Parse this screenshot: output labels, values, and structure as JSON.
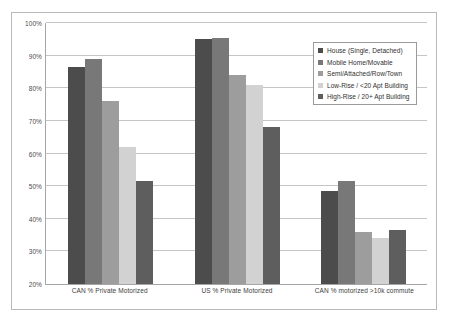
{
  "chart_data": {
    "type": "bar",
    "title": "",
    "xlabel": "",
    "ylabel": "",
    "ylim": [
      20,
      100
    ],
    "ytick_labels": [
      "100%",
      "90%",
      "80%",
      "70%",
      "60%",
      "50%",
      "40%",
      "30%",
      "20%"
    ],
    "ytick_values": [
      100,
      90,
      80,
      70,
      60,
      50,
      40,
      30,
      20
    ],
    "grid": true,
    "legend_position": "top-right",
    "categories": [
      "CAN % Private Motorized",
      "US % Private Motorized",
      "CAN % motorized  >10k commute"
    ],
    "series": [
      {
        "name": "House (Single, Detached)",
        "color": "#4c4c4c",
        "values": [
          86.5,
          95.0,
          48.5
        ]
      },
      {
        "name": "Mobile Home/Movable",
        "color": "#787878",
        "values": [
          89.0,
          95.5,
          51.5
        ]
      },
      {
        "name": "Semi/Attached/Row/Town",
        "color": "#9d9d9d",
        "values": [
          76.0,
          84.0,
          36.0
        ]
      },
      {
        "name": "Low-Rise / <20 Apt Building",
        "color": "#d2d2d2",
        "values": [
          62.0,
          81.0,
          34.0
        ]
      },
      {
        "name": "High-Rise / 20+ Apt Building",
        "color": "#5e5e5e",
        "values": [
          51.5,
          68.0,
          36.5
        ]
      }
    ]
  }
}
